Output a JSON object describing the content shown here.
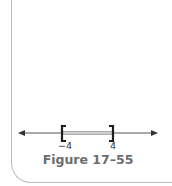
{
  "figure": {
    "caption": "Figure 17–55",
    "number_line": {
      "interval": "[-4, 4]",
      "left_endpoint": {
        "value": -4,
        "label": "−4",
        "type": "closed-bracket"
      },
      "right_endpoint": {
        "value": 4,
        "label": "4",
        "type": "closed-bracket"
      },
      "arrows": [
        "left-arrow",
        "right-arrow"
      ]
    }
  },
  "colors": {
    "frame": "#bdbdbd",
    "axis": "#444444",
    "interval_fill": "#cfcfcf",
    "bracket": "#222222",
    "caption": "#6d6d6d"
  }
}
